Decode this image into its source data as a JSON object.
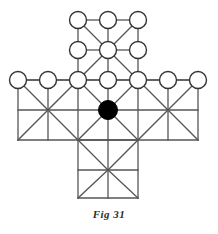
{
  "figure": {
    "caption": "Fig 31",
    "title": "Fig 31",
    "shape": "cross",
    "grid_step": 30,
    "colors": {
      "line": "#555555",
      "node_stroke": "#333333",
      "node_fill": "#ffffff",
      "marked_node_fill": "#000000",
      "background": "#ffffff",
      "caption": "#2b2b2b"
    },
    "style": {
      "line_width": 1.3,
      "node_radius": 8.5,
      "node_stroke_width": 1.4,
      "marked_node_radius": 9.5
    }
  },
  "lattice": {
    "x_coords": [
      18,
      48,
      78,
      108,
      138,
      168,
      198
    ],
    "y_coords": [
      20,
      50,
      80,
      110,
      140,
      170,
      198
    ],
    "open_nodes": [
      {
        "id": "n-t1",
        "x": 78,
        "y": 20
      },
      {
        "id": "n-t2",
        "x": 108,
        "y": 20
      },
      {
        "id": "n-t3",
        "x": 138,
        "y": 20
      },
      {
        "id": "n-m1",
        "x": 78,
        "y": 50
      },
      {
        "id": "n-m2",
        "x": 108,
        "y": 50
      },
      {
        "id": "n-m3",
        "x": 138,
        "y": 50
      },
      {
        "id": "n-w1",
        "x": 18,
        "y": 80
      },
      {
        "id": "n-w2",
        "x": 48,
        "y": 80
      },
      {
        "id": "n-w3",
        "x": 78,
        "y": 80
      },
      {
        "id": "n-w4",
        "x": 108,
        "y": 80
      },
      {
        "id": "n-w5",
        "x": 138,
        "y": 80
      },
      {
        "id": "n-w6",
        "x": 168,
        "y": 80
      },
      {
        "id": "n-w7",
        "x": 198,
        "y": 80
      }
    ],
    "marked_nodes": [
      {
        "id": "n-centre",
        "x": 108,
        "y": 110,
        "label": "centre"
      }
    ],
    "edges": [
      {
        "x1": 78,
        "y1": 20,
        "x2": 108,
        "y2": 20
      },
      {
        "x1": 108,
        "y1": 20,
        "x2": 138,
        "y2": 20
      },
      {
        "x1": 78,
        "y1": 50,
        "x2": 108,
        "y2": 50
      },
      {
        "x1": 108,
        "y1": 50,
        "x2": 138,
        "y2": 50
      },
      {
        "x1": 78,
        "y1": 80,
        "x2": 108,
        "y2": 80
      },
      {
        "x1": 108,
        "y1": 80,
        "x2": 138,
        "y2": 80
      },
      {
        "x1": 18,
        "y1": 80,
        "x2": 48,
        "y2": 80
      },
      {
        "x1": 48,
        "y1": 80,
        "x2": 78,
        "y2": 80
      },
      {
        "x1": 138,
        "y1": 80,
        "x2": 168,
        "y2": 80
      },
      {
        "x1": 168,
        "y1": 80,
        "x2": 198,
        "y2": 80
      },
      {
        "x1": 78,
        "y1": 20,
        "x2": 78,
        "y2": 50
      },
      {
        "x1": 78,
        "y1": 50,
        "x2": 78,
        "y2": 80
      },
      {
        "x1": 108,
        "y1": 20,
        "x2": 108,
        "y2": 50
      },
      {
        "x1": 108,
        "y1": 50,
        "x2": 108,
        "y2": 80
      },
      {
        "x1": 138,
        "y1": 20,
        "x2": 138,
        "y2": 50
      },
      {
        "x1": 138,
        "y1": 50,
        "x2": 138,
        "y2": 80
      },
      {
        "x1": 18,
        "y1": 80,
        "x2": 198,
        "y2": 80
      },
      {
        "x1": 18,
        "y1": 110,
        "x2": 198,
        "y2": 110
      },
      {
        "x1": 18,
        "y1": 140,
        "x2": 198,
        "y2": 140
      },
      {
        "x1": 18,
        "y1": 80,
        "x2": 18,
        "y2": 140
      },
      {
        "x1": 48,
        "y1": 80,
        "x2": 48,
        "y2": 140
      },
      {
        "x1": 78,
        "y1": 80,
        "x2": 78,
        "y2": 140
      },
      {
        "x1": 108,
        "y1": 80,
        "x2": 108,
        "y2": 140
      },
      {
        "x1": 138,
        "y1": 80,
        "x2": 138,
        "y2": 140
      },
      {
        "x1": 168,
        "y1": 80,
        "x2": 168,
        "y2": 140
      },
      {
        "x1": 198,
        "y1": 80,
        "x2": 198,
        "y2": 140
      },
      {
        "x1": 78,
        "y1": 140,
        "x2": 138,
        "y2": 140
      },
      {
        "x1": 78,
        "y1": 170,
        "x2": 138,
        "y2": 170
      },
      {
        "x1": 78,
        "y1": 198,
        "x2": 138,
        "y2": 198
      },
      {
        "x1": 78,
        "y1": 140,
        "x2": 78,
        "y2": 198
      },
      {
        "x1": 108,
        "y1": 140,
        "x2": 108,
        "y2": 198
      },
      {
        "x1": 138,
        "y1": 140,
        "x2": 138,
        "y2": 198
      }
    ],
    "diagonals": [
      {
        "x1": 78,
        "y1": 20,
        "x2": 108,
        "y2": 50
      },
      {
        "x1": 138,
        "y1": 20,
        "x2": 108,
        "y2": 50
      },
      {
        "x1": 78,
        "y1": 80,
        "x2": 108,
        "y2": 50
      },
      {
        "x1": 138,
        "y1": 80,
        "x2": 108,
        "y2": 50
      },
      {
        "x1": 18,
        "y1": 80,
        "x2": 48,
        "y2": 110
      },
      {
        "x1": 48,
        "y1": 110,
        "x2": 78,
        "y2": 80
      },
      {
        "x1": 18,
        "y1": 140,
        "x2": 48,
        "y2": 110
      },
      {
        "x1": 48,
        "y1": 110,
        "x2": 78,
        "y2": 140
      },
      {
        "x1": 78,
        "y1": 80,
        "x2": 108,
        "y2": 110
      },
      {
        "x1": 138,
        "y1": 80,
        "x2": 108,
        "y2": 110
      },
      {
        "x1": 78,
        "y1": 140,
        "x2": 108,
        "y2": 110
      },
      {
        "x1": 138,
        "y1": 140,
        "x2": 108,
        "y2": 110
      },
      {
        "x1": 138,
        "y1": 80,
        "x2": 168,
        "y2": 110
      },
      {
        "x1": 168,
        "y1": 110,
        "x2": 198,
        "y2": 80
      },
      {
        "x1": 138,
        "y1": 140,
        "x2": 168,
        "y2": 110
      },
      {
        "x1": 168,
        "y1": 110,
        "x2": 198,
        "y2": 140
      },
      {
        "x1": 78,
        "y1": 140,
        "x2": 108,
        "y2": 170
      },
      {
        "x1": 138,
        "y1": 140,
        "x2": 108,
        "y2": 170
      },
      {
        "x1": 78,
        "y1": 198,
        "x2": 108,
        "y2": 170
      },
      {
        "x1": 138,
        "y1": 198,
        "x2": 108,
        "y2": 170
      }
    ]
  }
}
